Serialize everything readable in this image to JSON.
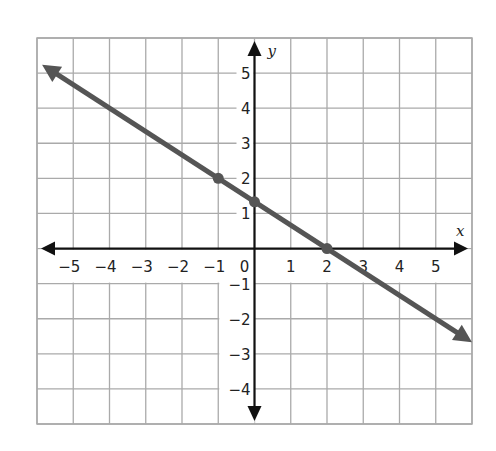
{
  "chart_data": {
    "type": "line",
    "title": "",
    "xlabel": "x",
    "ylabel": "y",
    "xlim": [
      -6,
      6
    ],
    "ylim": [
      -5,
      6
    ],
    "grid": true,
    "x_ticks": [
      -5,
      -4,
      -3,
      -2,
      -1,
      0,
      1,
      2,
      3,
      4,
      5
    ],
    "y_ticks": [
      -4,
      -3,
      -2,
      -1,
      1,
      2,
      3,
      4,
      5
    ],
    "series": [
      {
        "name": "line",
        "equation": "y = -2/3 x + 4/3",
        "slope": -0.6667,
        "intercept": 1.3333,
        "x_range": [
          -5.86,
          6
        ],
        "arrows": "both",
        "color": "#555555",
        "points": [
          {
            "x": -1,
            "y": 2
          },
          {
            "x": 0,
            "y": 1.33
          },
          {
            "x": 2,
            "y": 0
          }
        ]
      }
    ]
  },
  "style": {
    "grid_color": "#aaaaaa",
    "axis_color": "#111111",
    "line_color": "#555555"
  }
}
